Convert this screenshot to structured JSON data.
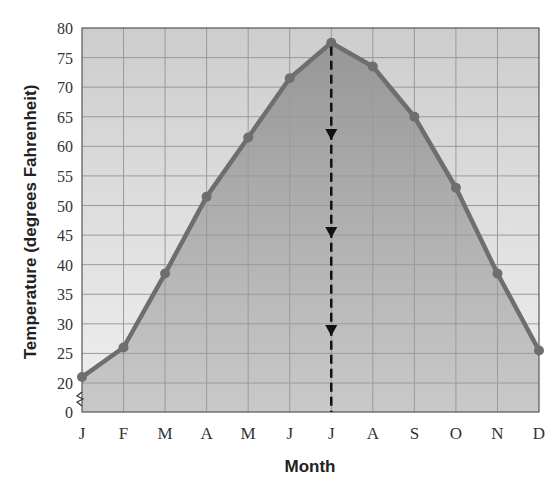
{
  "chart_data": {
    "type": "area",
    "title": "",
    "xlabel": "Month",
    "ylabel": "Temperature (degrees Fahrenheit)",
    "categories": [
      "J",
      "F",
      "M",
      "A",
      "M",
      "J",
      "J",
      "A",
      "S",
      "O",
      "N",
      "D"
    ],
    "series": [
      {
        "name": "Average monthly temperature",
        "values": [
          21,
          26,
          38.5,
          51.5,
          61.5,
          71.5,
          77.5,
          73.5,
          65,
          53,
          38.5,
          25.5
        ]
      }
    ],
    "y_ticks": [
      0,
      20,
      25,
      30,
      35,
      40,
      45,
      50,
      55,
      60,
      65,
      70,
      75,
      80
    ],
    "ylim": [
      20,
      80
    ],
    "y_axis_break": {
      "between": [
        0,
        20
      ]
    },
    "grid": true,
    "annotations": [
      {
        "type": "dashed-arrow-line",
        "x": "J (July)",
        "from_value": 77.5,
        "to_value": 0,
        "direction": "down",
        "arrow_count": 3
      }
    ],
    "legend": null
  },
  "axes": {
    "x_title": "Month",
    "y_title": "Temperature (degrees Fahrenheit)"
  },
  "colors": {
    "line": "#6e6e6e",
    "marker": "#6e6e6e",
    "fill_top": "#979797",
    "fill_bottom": "#c9c9c9",
    "bg_top": "#cdcdcd",
    "bg_bottom": "#f0f0f0",
    "grid": "#9a9a9a",
    "dashed": "#111111"
  }
}
